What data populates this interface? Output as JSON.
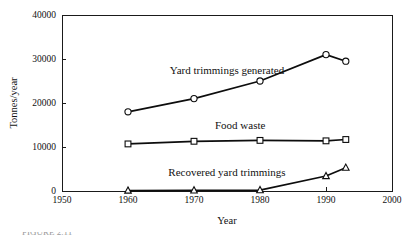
{
  "figure": {
    "caption_clipped": "FIGURE 2.11"
  },
  "chart_data": {
    "type": "line",
    "title": "",
    "xlabel": "Year",
    "ylabel": "Tonnes/year",
    "xlim": [
      1950,
      2000
    ],
    "ylim": [
      0,
      40000
    ],
    "xticks": [
      1950,
      1960,
      1970,
      1980,
      1990,
      2000
    ],
    "xtick_labels": [
      "1950",
      "1960",
      "1970",
      "1980",
      "1990",
      "2000"
    ],
    "yticks": [
      0,
      10000,
      20000,
      30000,
      40000
    ],
    "ytick_labels": [
      "0",
      "10000",
      "20000",
      "30000",
      "40000"
    ],
    "grid": false,
    "legend_position": "inline-annotations",
    "x": [
      1960,
      1970,
      1980,
      1990,
      1993
    ],
    "series": [
      {
        "name": "Yard trimmings generated",
        "marker": "circle",
        "values": [
          18000,
          21000,
          25000,
          31000,
          29500
        ],
        "label_x": 1975,
        "label_y": 26500
      },
      {
        "name": "Food waste",
        "marker": "square",
        "values": [
          10700,
          11300,
          11500,
          11400,
          11700
        ],
        "label_x": 1977,
        "label_y": 14200
      },
      {
        "name": "Recovered yard trimmings",
        "marker": "triangle",
        "values": [
          100,
          150,
          200,
          3400,
          5300
        ],
        "label_x": 1975,
        "label_y": 3300
      }
    ]
  }
}
